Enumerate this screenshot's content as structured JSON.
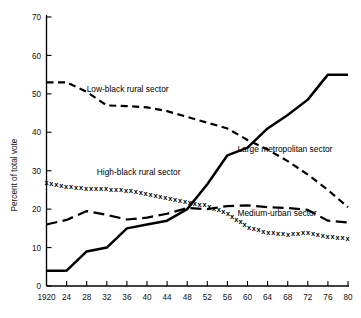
{
  "chart_data": {
    "type": "line",
    "title": "",
    "xlabel": "",
    "ylabel": "Percent of total vote",
    "xlim": [
      1920,
      1980
    ],
    "ylim": [
      0,
      70
    ],
    "grid": false,
    "legend_position": "inline-annotations",
    "x": [
      1920,
      1924,
      1928,
      1932,
      1936,
      1940,
      1944,
      1948,
      1952,
      1956,
      1960,
      1964,
      1968,
      1972,
      1976,
      1980
    ],
    "xtick_labels": [
      "1920",
      "24",
      "28",
      "32",
      "36",
      "40",
      "44",
      "48",
      "52",
      "56",
      "60",
      "64",
      "68",
      "72",
      "76",
      "80"
    ],
    "ytick_labels": [
      "0",
      "10",
      "20",
      "30",
      "40",
      "50",
      "60",
      "70"
    ],
    "ytick_values": [
      0,
      10,
      20,
      30,
      40,
      50,
      60,
      70
    ],
    "series": [
      {
        "name": "Low-black rural sector",
        "style": "short-dash",
        "label_x": 1928,
        "label_y": 50.5,
        "values": [
          53.0,
          53.0,
          50.5,
          47.0,
          46.8,
          46.5,
          45.5,
          44.0,
          42.5,
          41.0,
          38.0,
          35.5,
          32.5,
          29.0,
          25.0,
          20.5
        ]
      },
      {
        "name": "High-black rural sector",
        "style": "x-markers",
        "label_x": 1930,
        "label_y": 29.0,
        "values": [
          27.0,
          26.0,
          25.5,
          25.3,
          25.0,
          24.0,
          23.0,
          22.0,
          21.0,
          19.0,
          15.5,
          14.0,
          13.5,
          14.0,
          13.0,
          12.5
        ]
      },
      {
        "name": "Medium-urban sector",
        "style": "long-dash",
        "label_x": 1958,
        "label_y": 18.2,
        "values": [
          16.0,
          17.2,
          19.5,
          18.5,
          17.3,
          17.8,
          18.8,
          20.3,
          20.0,
          20.8,
          21.0,
          20.5,
          20.3,
          19.8,
          17.0,
          16.5
        ]
      },
      {
        "name": "Large metropolitan sector",
        "style": "solid",
        "label_x": 1958,
        "label_y": 35.0,
        "values": [
          4.0,
          4.0,
          9.0,
          10.0,
          15.0,
          16.0,
          17.0,
          20.0,
          26.5,
          34.0,
          36.0,
          41.0,
          44.5,
          48.5,
          55.0,
          55.0
        ]
      }
    ]
  }
}
